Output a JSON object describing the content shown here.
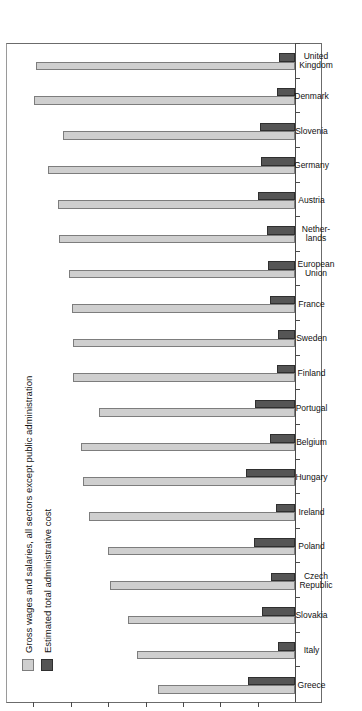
{
  "chart_data": {
    "type": "bar",
    "orientation": "horizontal",
    "title": "",
    "xlabel": "",
    "ylabel": "",
    "ylim": [
      0,
      38
    ],
    "grid": false,
    "axis_ticks": [
      5,
      10,
      15,
      20,
      25,
      30,
      35
    ],
    "legend_position": "top-left",
    "categories": [
      "Greece",
      "Italy",
      "Slovakia",
      "Czech\nRepublic",
      "Poland",
      "Ireland",
      "Hungary",
      "Belgium",
      "Portugal",
      "Finland",
      "Sweden",
      "France",
      "European\nUnion",
      "Nether-\nlands",
      "Austria",
      "Germany",
      "Slovenia",
      "Denmark",
      "United\nKingdom"
    ],
    "series": [
      {
        "name": "Gross wages and salaries, all sectors except public administration",
        "color": "#cfcfcf",
        "values": [
          18.3,
          21.2,
          22.3,
          24.8,
          25.0,
          27.5,
          28.4,
          28.6,
          26.2,
          29.7,
          29.7,
          29.8,
          30.2,
          31.6,
          31.7,
          33.0,
          31.0,
          34.9,
          34.7
        ]
      },
      {
        "name": "Estimated total administrative cost",
        "color": "#555555",
        "values": [
          6.3,
          2.3,
          4.4,
          3.2,
          5.5,
          2.6,
          6.5,
          3.3,
          5.3,
          2.4,
          2.3,
          3.3,
          3.6,
          3.7,
          4.9,
          4.6,
          4.7,
          2.4,
          2.1
        ]
      }
    ]
  },
  "legend": {
    "items": [
      {
        "label": "Gross wages and salaries, all sectors except public administration",
        "swatch": "light"
      },
      {
        "label": "Estimated total administrative cost",
        "swatch": "dark"
      }
    ]
  }
}
